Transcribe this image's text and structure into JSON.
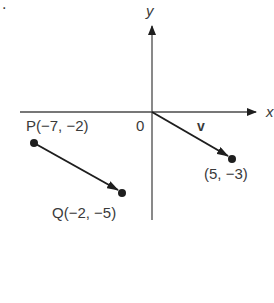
{
  "figure": {
    "problem_fragment": ".",
    "axes": {
      "x_label": "x",
      "y_label": "y",
      "origin_label": "0"
    },
    "vector_label": "v",
    "points": {
      "P": {
        "label": "P(−7, −2)",
        "x": -7,
        "y": -2
      },
      "Q": {
        "label": "Q(−2, −5)",
        "x": -2,
        "y": -5
      },
      "V_end": {
        "label": "(5, −3)",
        "x": 5,
        "y": -3
      }
    },
    "colors": {
      "ink": "#1e1e1e",
      "axis": "#4a4a4a",
      "text": "#3a3a3a"
    }
  }
}
